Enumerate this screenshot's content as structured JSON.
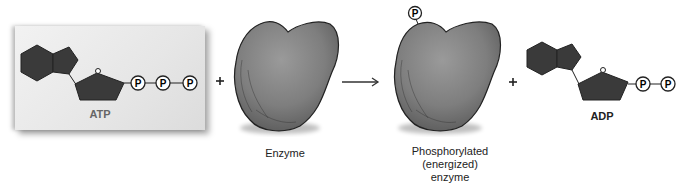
{
  "diagram": {
    "reactants": {
      "atp": {
        "label": "ATP",
        "phosphates": [
          "P",
          "P",
          "P"
        ]
      },
      "plus_1": "+",
      "enzyme": {
        "label": "Enzyme"
      }
    },
    "arrow": "→",
    "products": {
      "phosphorylated_enzyme": {
        "label_lines": [
          "Phosphorylated",
          "(energized)",
          "enzyme"
        ],
        "phosphate": "P"
      },
      "plus_2": "+",
      "adp": {
        "label": "ADP",
        "phosphates": [
          "P",
          "P"
        ]
      }
    },
    "colors": {
      "molecule_fill": "#3a3a3a",
      "enzyme_fill": "#8a8a8a",
      "atp_box_bg": "#e8e8e8",
      "atp_label": "#666666",
      "text": "#222222"
    }
  }
}
